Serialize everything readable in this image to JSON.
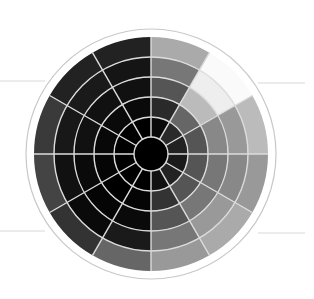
{
  "diagram": {
    "type": "polar-grayscale-wheel",
    "center": [
      151,
      154
    ],
    "outer_circle_radius": 125,
    "wheel_radius": 117,
    "core_radius": 17,
    "ring_radii": [
      17,
      37,
      57,
      77,
      97,
      117
    ],
    "sector_count": 12,
    "sector_start_deg": 0,
    "colors": {
      "background": "#ffffff",
      "core": "#000000",
      "grid_line": "#dcdcdc",
      "outer_circle": "#c8c8c8",
      "side_line": "#d8d8d8"
    },
    "cells": [
      [
        "#0a0a0a",
        "#2a2a2a",
        "#555555",
        "#777777",
        "#aaaaaa"
      ],
      [
        "#2a2a2a",
        "#666666",
        "#bbbbbb",
        "#eeeeee",
        "#fafafa"
      ],
      [
        "#222222",
        "#555555",
        "#888888",
        "#999999",
        "#bbbbbb"
      ],
      [
        "#1a1a1a",
        "#555555",
        "#777777",
        "#888888",
        "#999999"
      ],
      [
        "#222222",
        "#555555",
        "#777777",
        "#999999",
        "#aaaaaa"
      ],
      [
        "#111111",
        "#333333",
        "#555555",
        "#777777",
        "#999999"
      ],
      [
        "#000000",
        "#050505",
        "#0a0a0a",
        "#1a1a1a",
        "#666666"
      ],
      [
        "#000000",
        "#000000",
        "#050505",
        "#0a0a0a",
        "#333333"
      ],
      [
        "#000000",
        "#050505",
        "#0a0a0a",
        "#111111",
        "#444444"
      ],
      [
        "#000000",
        "#080808",
        "#111111",
        "#181818",
        "#3a3a3a"
      ],
      [
        "#000000",
        "#0a0a0a",
        "#111111",
        "#1a1a1a",
        "#222222"
      ],
      [
        "#000000",
        "#0a0a0a",
        "#111111",
        "#151515",
        "#222222"
      ]
    ],
    "side_lines": [
      {
        "x1": 0,
        "y1": 81,
        "x2": 45,
        "y2": 81
      },
      {
        "x1": 258,
        "y1": 83,
        "x2": 305,
        "y2": 83
      },
      {
        "x1": 0,
        "y1": 231,
        "x2": 45,
        "y2": 231
      },
      {
        "x1": 258,
        "y1": 233,
        "x2": 305,
        "y2": 233
      }
    ]
  }
}
